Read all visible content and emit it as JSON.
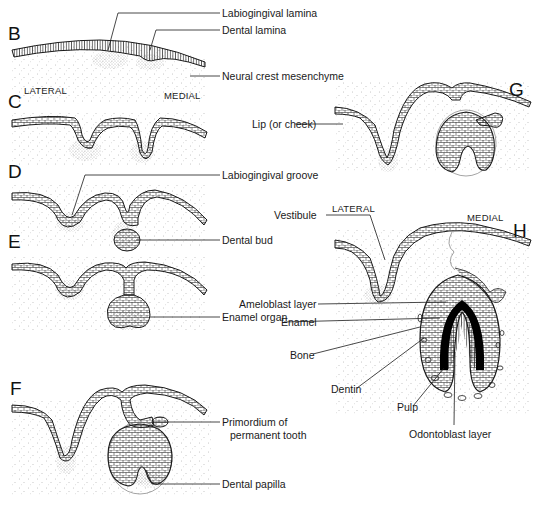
{
  "figure": {
    "panels": [
      {
        "id": "B",
        "letter": "B",
        "x": 8,
        "y": 27
      },
      {
        "id": "C",
        "letter": "C",
        "x": 8,
        "y": 95
      },
      {
        "id": "D",
        "letter": "D",
        "x": 8,
        "y": 165
      },
      {
        "id": "E",
        "letter": "E",
        "x": 8,
        "y": 235
      },
      {
        "id": "F",
        "letter": "F",
        "x": 10,
        "y": 382
      },
      {
        "id": "G",
        "letter": "G",
        "x": 509,
        "y": 83
      },
      {
        "id": "H",
        "letter": "H",
        "x": 513,
        "y": 224
      }
    ],
    "orientation": {
      "left_top": {
        "lateral": "LATERAL",
        "medial": "MEDIAL"
      },
      "right_h": {
        "lateral": "LATERAL",
        "medial": "MEDIAL"
      }
    },
    "labels": {
      "labiogingival_lamina": "Labiogingival lamina",
      "dental_lamina": "Dental lamina",
      "neural_crest_mesenchyme": "Neural crest mesenchyme",
      "lip_or_cheek": "Lip (or cheek)",
      "labiogingival_groove": "Labiogingival groove",
      "dental_bud": "Dental bud",
      "vestibule": "Vestibule",
      "enamel_organ": "Enamel organ",
      "ameloblast_layer": "Ameloblast layer",
      "enamel": "Enamel",
      "bone": "Bone",
      "dentin": "Dentin",
      "pulp": "Pulp",
      "odontoblast_layer": "Odontoblast layer",
      "primordium_line1": "Primordium of",
      "primordium_line2": "permanent tooth",
      "dental_papilla": "Dental papilla"
    },
    "colors": {
      "ink": "#1a1a1a",
      "background": "#ffffff",
      "stipple": "#8a8a8a",
      "enamel": "#000000"
    }
  }
}
